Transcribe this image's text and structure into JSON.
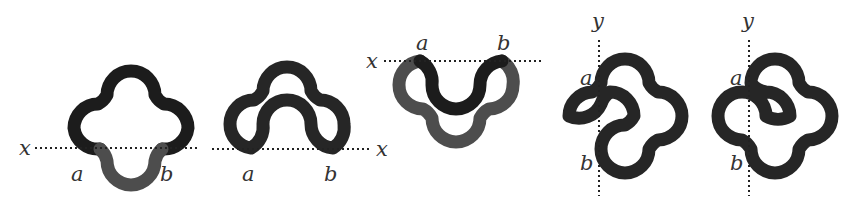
{
  "figure": {
    "colors": {
      "dark_segment": "#1c1c1c",
      "light_segment": "#4d4d4d",
      "guide_line": "#222222",
      "label": "#333333"
    },
    "panels": [
      {
        "id": 1,
        "axis": "x",
        "labels": {
          "axis": "x",
          "p1": "a",
          "p2": "b"
        }
      },
      {
        "id": 2,
        "axis": "x",
        "labels": {
          "axis": "x",
          "p1": "a",
          "p2": "b"
        }
      },
      {
        "id": 3,
        "axis": "x",
        "labels": {
          "axis": "x",
          "p1": "a",
          "p2": "b"
        }
      },
      {
        "id": 4,
        "axis": "y",
        "labels": {
          "axis": "y",
          "p1": "a",
          "p2": "b"
        }
      },
      {
        "id": 5,
        "axis": "y",
        "labels": {
          "axis": "y",
          "p1": "a",
          "p2": "b"
        }
      }
    ]
  }
}
